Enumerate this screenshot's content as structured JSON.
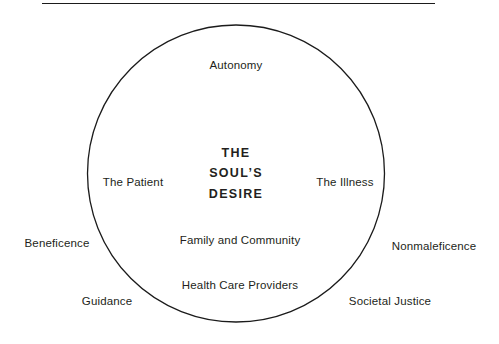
{
  "figure": {
    "title_rule": "horizontal-rule",
    "background_color": "#ffffff",
    "line_color": "#1b1b1b",
    "text_color": "#231f20"
  },
  "center": {
    "line1": "THE",
    "line2": "SOUL’S",
    "line3": "DESIRE"
  },
  "inside_labels": [
    {
      "id": "autonomy",
      "text": "Autonomy"
    },
    {
      "id": "the-patient",
      "text": "The Patient"
    },
    {
      "id": "the-illness",
      "text": "The Illness"
    },
    {
      "id": "family-and-community",
      "text": "Family and Community"
    },
    {
      "id": "health-care-providers",
      "text": "Health Care Providers"
    }
  ],
  "outside_labels": [
    {
      "id": "beneficence",
      "text": "Beneficence"
    },
    {
      "id": "nonmaleficence",
      "text": "Nonmaleficence"
    },
    {
      "id": "guidance",
      "text": "Guidance"
    },
    {
      "id": "societal-justice",
      "text": "Societal Justice"
    }
  ]
}
